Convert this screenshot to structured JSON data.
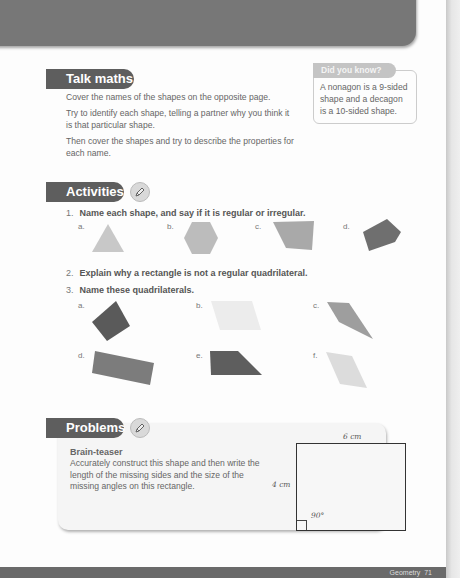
{
  "talk_maths": {
    "heading": "Talk maths",
    "paragraphs": [
      "Cover the names of the shapes on the opposite page.",
      "Try to identify each shape, telling a partner why you think it is that particular shape.",
      "Then cover the shapes and try to describe the properties for each name."
    ]
  },
  "did_you_know": {
    "heading": "Did you know?",
    "text": "A nonagon is a 9-sided shape and a decagon is a 10-sided shape."
  },
  "activities": {
    "heading": "Activities",
    "icon": "pencil-icon",
    "questions": [
      {
        "number": "1.",
        "text": "Name each shape, and say if it is regular or irregular.",
        "items": [
          {
            "label": "a.",
            "shape": "equilateral triangle",
            "color": "#c8c8c8"
          },
          {
            "label": "b.",
            "shape": "regular hexagon",
            "color": "#bcbcbc"
          },
          {
            "label": "c.",
            "shape": "irregular quadrilateral",
            "color": "#a9a9a9"
          },
          {
            "label": "d.",
            "shape": "irregular pentagon",
            "color": "#6f6f6f"
          }
        ]
      },
      {
        "number": "2.",
        "text": "Explain why a rectangle is not a regular quadrilateral."
      },
      {
        "number": "3.",
        "text": "Name these quadrilaterals.",
        "items": [
          {
            "label": "a.",
            "shape": "square",
            "color": "#5a5a5a"
          },
          {
            "label": "b.",
            "shape": "parallelogram",
            "color": "#ececec"
          },
          {
            "label": "c.",
            "shape": "kite",
            "color": "#9e9e9e"
          },
          {
            "label": "d.",
            "shape": "rectangle",
            "color": "#7c7c7c"
          },
          {
            "label": "e.",
            "shape": "trapezium",
            "color": "#5e5e5e"
          },
          {
            "label": "f.",
            "shape": "rhombus",
            "color": "#dcdcdc"
          }
        ]
      }
    ]
  },
  "problems": {
    "heading": "Problems",
    "icon": "pencil-icon",
    "title": "Brain-teaser",
    "text": "Accurately construct this shape and then write the length of the missing sides and the size of the missing angles on this rectangle.",
    "diagram": {
      "top_label": "6 cm",
      "left_label": "4 cm",
      "angle_label": "90°"
    }
  },
  "footer": {
    "section": "Geometry",
    "page_number": "71"
  }
}
